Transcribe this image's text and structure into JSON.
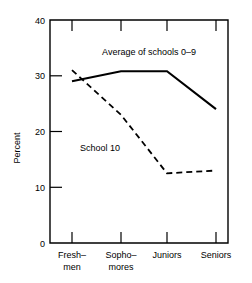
{
  "chart_data": {
    "type": "line",
    "title": "",
    "xlabel": "",
    "ylabel": "Percent",
    "ylim": [
      0,
      40
    ],
    "yticks": [
      0,
      10,
      20,
      30,
      40
    ],
    "ytick_labels": [
      "0",
      "10",
      "20",
      "30",
      "40"
    ],
    "grid": false,
    "legend_position": "inline-annotations",
    "categories": [
      "Fresh-\nmen",
      "Sopho-\nmores",
      "Juniors",
      "Seniors"
    ],
    "category_lines": [
      [
        "Fresh–",
        "men"
      ],
      [
        "Sopho–",
        "mores"
      ],
      [
        "Juniors",
        ""
      ],
      [
        "Seniors",
        ""
      ]
    ],
    "series": [
      {
        "name": "Average of schools 0–9",
        "style": "solid",
        "color": "#000000",
        "values": [
          29,
          30.8,
          30.8,
          24
        ]
      },
      {
        "name": "School 10",
        "style": "dashed",
        "color": "#000000",
        "values": [
          31,
          23,
          12.5,
          13
        ]
      }
    ],
    "annotations": [
      {
        "text": "Average of schools 0–9",
        "x_px": 149,
        "y_px": 55
      },
      {
        "text": "School 10",
        "x_px": 100,
        "y_px": 151
      }
    ]
  }
}
